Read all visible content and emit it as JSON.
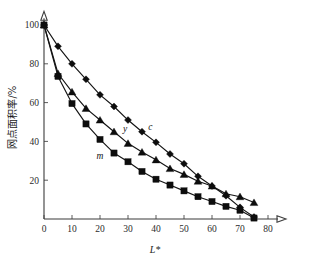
{
  "chart_data": {
    "type": "line",
    "title": "",
    "xlabel": "L*",
    "ylabel": "网点面积率/%",
    "xlim": [
      0,
      85
    ],
    "ylim": [
      0,
      105
    ],
    "xticks": [
      0,
      10,
      20,
      30,
      40,
      50,
      60,
      70,
      80
    ],
    "yticks": [
      20,
      40,
      60,
      80,
      100
    ],
    "xticklabels": [
      "0",
      "10",
      "20",
      "30",
      "40",
      "50",
      "60",
      "70",
      "80"
    ],
    "yticklabels": [
      "20",
      "40",
      "60",
      "80",
      "100"
    ],
    "grid": false,
    "legend": "inline-annotations",
    "x": [
      0,
      5,
      10,
      15,
      20,
      25,
      30,
      35,
      40,
      45,
      50,
      55,
      60,
      65,
      70,
      75
    ],
    "series": [
      {
        "name": "c",
        "marker": "diamond",
        "label": "c",
        "label_x": 38,
        "label_y": 46,
        "values": [
          100,
          89,
          80,
          72,
          64,
          58,
          51,
          45,
          39.5,
          33.5,
          28.5,
          22,
          17,
          12,
          6,
          1
        ]
      },
      {
        "name": "y",
        "marker": "triangle",
        "label": "y",
        "label_x": 29,
        "label_y": 45,
        "values": [
          100,
          75,
          65.5,
          57,
          51,
          45,
          39,
          34.5,
          30.5,
          26,
          23,
          19.5,
          17,
          13,
          11.5,
          8.5
        ]
      },
      {
        "name": "m",
        "marker": "square",
        "label": "m",
        "label_x": 20,
        "label_y": 31,
        "values": [
          100,
          73.5,
          59.5,
          49,
          41,
          34,
          29.5,
          24.5,
          20.5,
          17.5,
          14.5,
          11.5,
          9,
          6.5,
          4.5,
          0.5
        ]
      }
    ],
    "colors": {
      "marker": "#0d0d0d",
      "line": "#141414",
      "axis": "#3b3b3b",
      "background": "#ffffff"
    }
  }
}
